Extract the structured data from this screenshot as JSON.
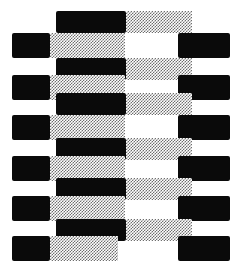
{
  "figure": {
    "type": "op-art-pattern",
    "width": 235,
    "height": 268,
    "background_color": "#ffffff",
    "black_color": "#0a0a0a",
    "halftone_color": "#6e6e6e",
    "halftone_description": "50% checkerboard dither screen",
    "row_count": 13,
    "row_types": [
      "odd-long",
      "even-split"
    ],
    "rows": [
      {
        "index": 0,
        "type": "odd-long",
        "y": 11,
        "height": 22,
        "segments": [
          {
            "name": "center-black",
            "fill": "black",
            "x": 56,
            "width": 70
          },
          {
            "name": "right-halftone",
            "fill": "halftone",
            "x": 126,
            "width": 66
          }
        ]
      },
      {
        "index": 1,
        "type": "even-split",
        "y": 33,
        "height": 25,
        "segments": [
          {
            "name": "left-black",
            "fill": "black",
            "x": 12,
            "width": 38
          },
          {
            "name": "left-halftone",
            "fill": "halftone",
            "x": 50,
            "width": 75
          },
          {
            "name": "right-black",
            "fill": "black",
            "x": 178,
            "width": 52
          }
        ]
      },
      {
        "index": 2,
        "type": "odd-long",
        "y": 58,
        "height": 22,
        "segments": [
          {
            "name": "center-black",
            "fill": "black",
            "x": 56,
            "width": 70
          },
          {
            "name": "right-halftone",
            "fill": "halftone",
            "x": 126,
            "width": 66
          }
        ]
      },
      {
        "index": 3,
        "type": "even-split",
        "y": 75,
        "height": 25,
        "segments": [
          {
            "name": "left-black",
            "fill": "black",
            "x": 12,
            "width": 38
          },
          {
            "name": "left-halftone",
            "fill": "halftone",
            "x": 50,
            "width": 75
          },
          {
            "name": "right-black",
            "fill": "black",
            "x": 178,
            "width": 52
          }
        ]
      },
      {
        "index": 4,
        "type": "odd-long",
        "y": 93,
        "height": 22,
        "segments": [
          {
            "name": "center-black",
            "fill": "black",
            "x": 56,
            "width": 70
          },
          {
            "name": "right-halftone",
            "fill": "halftone",
            "x": 126,
            "width": 66
          }
        ]
      },
      {
        "index": 5,
        "type": "even-split",
        "y": 115,
        "height": 25,
        "segments": [
          {
            "name": "left-black",
            "fill": "black",
            "x": 12,
            "width": 38
          },
          {
            "name": "left-halftone",
            "fill": "halftone",
            "x": 50,
            "width": 75
          },
          {
            "name": "right-black",
            "fill": "black",
            "x": 178,
            "width": 52
          }
        ]
      },
      {
        "index": 6,
        "type": "odd-long",
        "y": 138,
        "height": 22,
        "segments": [
          {
            "name": "center-black",
            "fill": "black",
            "x": 56,
            "width": 70
          },
          {
            "name": "right-halftone",
            "fill": "halftone",
            "x": 126,
            "width": 66
          }
        ]
      },
      {
        "index": 7,
        "type": "even-split",
        "y": 156,
        "height": 25,
        "segments": [
          {
            "name": "left-black",
            "fill": "black",
            "x": 12,
            "width": 38
          },
          {
            "name": "left-halftone",
            "fill": "halftone",
            "x": 50,
            "width": 75
          },
          {
            "name": "right-black",
            "fill": "black",
            "x": 178,
            "width": 52
          }
        ]
      },
      {
        "index": 8,
        "type": "odd-long",
        "y": 178,
        "height": 22,
        "segments": [
          {
            "name": "center-black",
            "fill": "black",
            "x": 56,
            "width": 70
          },
          {
            "name": "right-halftone",
            "fill": "halftone",
            "x": 126,
            "width": 66
          }
        ]
      },
      {
        "index": 9,
        "type": "even-split",
        "y": 196,
        "height": 25,
        "segments": [
          {
            "name": "left-black",
            "fill": "black",
            "x": 12,
            "width": 38
          },
          {
            "name": "left-halftone",
            "fill": "halftone",
            "x": 50,
            "width": 75
          },
          {
            "name": "right-black",
            "fill": "black",
            "x": 178,
            "width": 52
          }
        ]
      },
      {
        "index": 10,
        "type": "odd-long",
        "y": 219,
        "height": 22,
        "segments": [
          {
            "name": "center-black",
            "fill": "black",
            "x": 56,
            "width": 70
          },
          {
            "name": "right-halftone",
            "fill": "halftone",
            "x": 126,
            "width": 66
          }
        ]
      },
      {
        "index": 11,
        "type": "even-split",
        "y": 236,
        "height": 25,
        "segments": [
          {
            "name": "left-black",
            "fill": "black",
            "x": 12,
            "width": 38
          },
          {
            "name": "left-halftone",
            "fill": "halftone",
            "x": 50,
            "width": 68
          },
          {
            "name": "right-black",
            "fill": "black",
            "x": 178,
            "width": 52
          }
        ]
      }
    ]
  }
}
